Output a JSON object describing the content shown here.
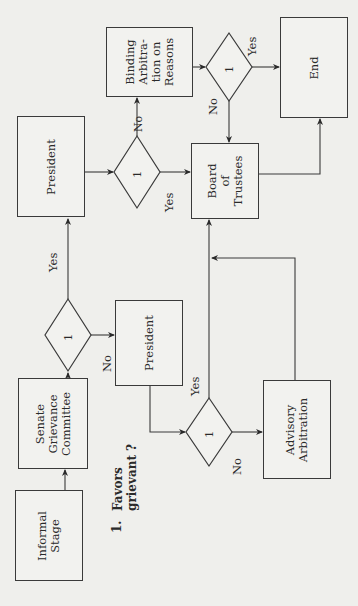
{
  "diagram": {
    "type": "flowchart",
    "orientation": "rotated-90-counterclockwise",
    "nodes": {
      "informal_stage": "Informal\nStage",
      "senate_committee": "Senate\nGrievance\nCommittee",
      "president_top": "President",
      "president_mid": "President",
      "binding_arbitration": "Binding\nArbitra-\ntion on\nReasons",
      "board_of_trustees": "Board\nof\nTrustees",
      "advisory_arbitration": "Advisory\nArbitration",
      "end": "End"
    },
    "decisions": {
      "d1": "1",
      "d2": "1",
      "d3": "1",
      "d4": "1"
    },
    "edge_labels": {
      "d1_yes": "Yes",
      "d1_no": "No",
      "d2_no": "No",
      "d2_yes": "Yes",
      "d3_yes": "Yes",
      "d3_no": "No",
      "d4_yes": "Yes",
      "d4_no": "No"
    },
    "legend": {
      "number": "1.",
      "text": "Favors\ngrievant ?"
    },
    "edges": [
      {
        "from": "Informal Stage",
        "to": "Senate Grievance Committee"
      },
      {
        "from": "Senate Grievance Committee",
        "to": "Decision 1 (Senate)"
      },
      {
        "from": "Decision 1 (Senate)",
        "to": "President (top)",
        "label": "Yes"
      },
      {
        "from": "Decision 1 (Senate)",
        "to": "President (middle)",
        "label": "No"
      },
      {
        "from": "President (top)",
        "to": "Decision 2"
      },
      {
        "from": "Decision 2",
        "to": "Binding Arbitration on Reasons",
        "label": "No"
      },
      {
        "from": "Decision 2",
        "to": "Board of Trustees",
        "label": "Yes"
      },
      {
        "from": "President (middle)",
        "to": "Decision 3"
      },
      {
        "from": "Decision 3",
        "to": "Board of Trustees",
        "label": "Yes"
      },
      {
        "from": "Decision 3",
        "to": "Advisory Arbitration",
        "label": "No"
      },
      {
        "from": "Advisory Arbitration",
        "to": "Board of Trustees"
      },
      {
        "from": "Binding Arbitration on Reasons",
        "to": "Decision 4"
      },
      {
        "from": "Decision 4",
        "to": "End",
        "label": "Yes"
      },
      {
        "from": "Decision 4",
        "to": "Board of Trustees",
        "label": "No"
      },
      {
        "from": "Board of Trustees",
        "to": "End"
      }
    ]
  },
  "colors": {
    "background": "#efefec",
    "line": "#3a3a3a",
    "text": "#2a2a2a"
  }
}
